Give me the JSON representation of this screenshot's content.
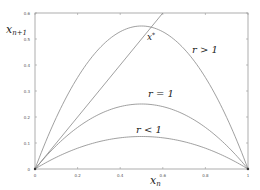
{
  "chart_data": {
    "type": "line",
    "title": "",
    "xlabel": "x_n",
    "ylabel": "x_{n+1}",
    "xlim": [
      0,
      1
    ],
    "ylim": [
      0,
      0.6
    ],
    "grid": false,
    "x_ticks": [
      "0",
      "0.2",
      "0.4",
      "0.6",
      "0.8",
      "1"
    ],
    "y_ticks": [
      "0",
      "0.1",
      "0.2",
      "0.3",
      "0.4",
      "0.5",
      "0.6"
    ],
    "series": [
      {
        "name": "r > 1",
        "function": "r*x*(1-x)",
        "r": 2.2,
        "peak": 0.55
      },
      {
        "name": "r = 1",
        "function": "r*x*(1-x)",
        "r": 1.0,
        "peak": 0.25
      },
      {
        "name": "r < 1",
        "function": "r*x*(1-x)",
        "r": 0.5,
        "peak": 0.125
      },
      {
        "name": "diagonal",
        "function": "x",
        "x": [
          0,
          0.6
        ],
        "values": [
          0,
          0.6
        ]
      }
    ],
    "annotations": [
      {
        "text": "x*",
        "x": 0.53,
        "y": 0.5
      },
      {
        "text": "r > 1",
        "x": 0.82,
        "y": 0.46
      },
      {
        "text": "r = 1",
        "x": 0.5,
        "y": 0.27
      },
      {
        "text": "r < 1",
        "x": 0.5,
        "y": 0.15
      }
    ]
  },
  "labels": {
    "xlabel_main": "x",
    "xlabel_sub": "n",
    "ylabel_main": "x",
    "ylabel_sub": "n+1",
    "fixed_point_main": "x",
    "fixed_point_sup": "*",
    "r_gt": "r > 1",
    "r_eq": "r = 1",
    "r_lt": "r < 1"
  },
  "colors": {
    "curve": "#888888",
    "frame": "#999999",
    "text": "#222222"
  }
}
